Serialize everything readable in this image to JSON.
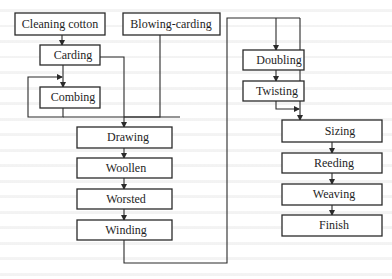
{
  "diagram": {
    "type": "process-flowchart",
    "nodes": [
      {
        "id": "cleaning_cotton",
        "label": "Cleaning cotton",
        "x": 15,
        "y": 13,
        "w": 90,
        "h": 22
      },
      {
        "id": "blowing_carding",
        "label": "Blowing-carding",
        "x": 123,
        "y": 13,
        "w": 97,
        "h": 22
      },
      {
        "id": "carding",
        "label": "Carding",
        "x": 40,
        "y": 45,
        "w": 60,
        "h": 20
      },
      {
        "id": "combing",
        "label": "Combing",
        "x": 40,
        "y": 87,
        "w": 60,
        "h": 21
      },
      {
        "id": "drawing",
        "label": "Drawing",
        "x": 77,
        "y": 127,
        "w": 95,
        "h": 21
      },
      {
        "id": "woollen",
        "label": "Woollen",
        "x": 77,
        "y": 158,
        "w": 95,
        "h": 20
      },
      {
        "id": "worsted",
        "label": "Worsted",
        "x": 77,
        "y": 189,
        "w": 95,
        "h": 20
      },
      {
        "id": "winding",
        "label": "Winding",
        "x": 77,
        "y": 220,
        "w": 95,
        "h": 20
      },
      {
        "id": "doubling",
        "label": "Doubling",
        "x": 243,
        "y": 50,
        "w": 61,
        "h": 20
      },
      {
        "id": "twisting",
        "label": "Twisting",
        "x": 243,
        "y": 81,
        "w": 61,
        "h": 20
      },
      {
        "id": "sizing",
        "label": "Sizing",
        "x": 282,
        "y": 120,
        "w": 100,
        "h": 22
      },
      {
        "id": "reeding",
        "label": "Reeding",
        "x": 282,
        "y": 153,
        "w": 100,
        "h": 20
      },
      {
        "id": "weaving",
        "label": "Weaving",
        "x": 282,
        "y": 184,
        "w": 100,
        "h": 21
      },
      {
        "id": "finish",
        "label": "Finish",
        "x": 282,
        "y": 215,
        "w": 100,
        "h": 21
      }
    ],
    "edges": [
      {
        "from": "cleaning_cotton",
        "to": "carding"
      },
      {
        "from": "carding",
        "to": "combing"
      },
      {
        "from": "combing",
        "to": "combing",
        "note": "feedback loop"
      },
      {
        "from": "carding",
        "to": "drawing"
      },
      {
        "from": "blowing_carding",
        "to": "drawing"
      },
      {
        "from": "combing",
        "to": "drawing"
      },
      {
        "from": "drawing",
        "to": "woollen"
      },
      {
        "from": "woollen",
        "to": "worsted"
      },
      {
        "from": "worsted",
        "to": "winding"
      },
      {
        "from": "winding",
        "to": "doubling"
      },
      {
        "from": "winding",
        "to": "sizing"
      },
      {
        "from": "doubling",
        "to": "twisting"
      },
      {
        "from": "twisting",
        "to": "sizing"
      },
      {
        "from": "sizing",
        "to": "reeding"
      },
      {
        "from": "reeding",
        "to": "weaving"
      },
      {
        "from": "weaving",
        "to": "finish"
      }
    ]
  }
}
